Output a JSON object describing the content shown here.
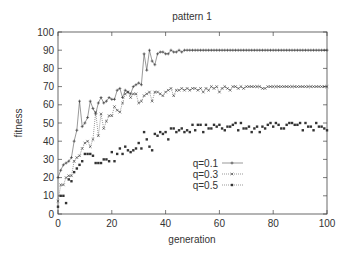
{
  "chart_data": {
    "type": "line",
    "title": "pattern 1",
    "xlabel": "generation",
    "ylabel": "fitness",
    "xlim": [
      0,
      100
    ],
    "ylim": [
      0,
      100
    ],
    "xticks": [
      0,
      20,
      40,
      60,
      80,
      100
    ],
    "yticks": [
      0,
      10,
      20,
      30,
      40,
      50,
      60,
      70,
      80,
      90,
      100
    ],
    "grid": false,
    "legend_position": "inside-right",
    "series": [
      {
        "name": "q=0.1",
        "style": "solid",
        "marker": "+",
        "values": [
          20,
          24,
          27,
          28,
          29,
          31,
          40,
          46,
          62,
          48,
          50,
          53,
          62,
          58,
          55,
          61,
          64,
          61,
          62,
          64,
          63,
          63,
          68,
          69,
          64,
          68,
          67,
          66,
          70,
          71,
          72,
          71,
          88,
          79,
          90,
          84,
          82,
          88,
          89,
          89,
          88,
          88,
          90,
          89,
          89,
          90,
          89,
          90,
          90,
          90,
          90,
          90,
          90,
          90,
          90,
          90,
          90,
          90,
          90,
          90,
          90,
          90,
          90,
          90,
          90,
          90,
          90,
          90,
          90,
          90,
          90,
          90,
          90,
          90,
          90,
          90,
          90,
          90,
          90,
          90,
          90,
          90,
          90,
          90,
          90,
          90,
          90,
          90,
          90,
          90,
          90,
          90,
          90,
          90,
          90,
          90,
          90,
          90,
          90,
          90,
          90
        ]
      },
      {
        "name": "q=0.3",
        "style": "dotted",
        "marker": "x",
        "values": [
          7,
          16,
          16,
          20,
          21,
          21,
          29,
          31,
          32,
          36,
          39,
          40,
          37,
          41,
          56,
          43,
          55,
          47,
          51,
          54,
          54,
          59,
          57,
          56,
          61,
          66,
          67,
          64,
          66,
          66,
          61,
          62,
          65,
          66,
          67,
          62,
          67,
          67,
          66,
          65,
          67,
          68,
          69,
          65,
          68,
          68,
          69,
          68,
          69,
          68,
          69,
          69,
          68,
          69,
          67,
          69,
          68,
          70,
          69,
          70,
          67,
          69,
          70,
          69,
          68,
          70,
          70,
          69,
          70,
          69,
          70,
          70,
          70,
          70,
          70,
          70,
          69,
          69,
          70,
          70,
          70,
          70,
          70,
          70,
          70,
          70,
          70,
          70,
          70,
          70,
          70,
          70,
          70,
          70,
          70,
          70,
          70,
          70,
          70,
          70,
          70
        ]
      },
      {
        "name": "q=0.5",
        "style": "dotted",
        "marker": "square",
        "values": [
          4,
          10,
          10,
          6,
          19,
          18,
          23,
          25,
          27,
          29,
          33,
          33,
          33,
          32,
          28,
          28,
          28,
          30,
          30,
          29,
          34,
          29,
          33,
          36,
          33,
          37,
          35,
          34,
          35,
          36,
          39,
          36,
          45,
          41,
          37,
          35,
          44,
          43,
          45,
          44,
          45,
          41,
          47,
          47,
          45,
          46,
          47,
          45,
          46,
          45,
          49,
          46,
          49,
          49,
          45,
          49,
          47,
          47,
          49,
          48,
          49,
          47,
          46,
          48,
          48,
          49,
          50,
          46,
          50,
          47,
          47,
          48,
          45,
          47,
          48,
          45,
          48,
          47,
          49,
          50,
          48,
          50,
          49,
          47,
          47,
          49,
          50,
          50,
          49,
          49,
          50,
          46,
          50,
          48,
          48,
          46,
          50,
          48,
          48,
          47,
          46
        ]
      }
    ]
  }
}
